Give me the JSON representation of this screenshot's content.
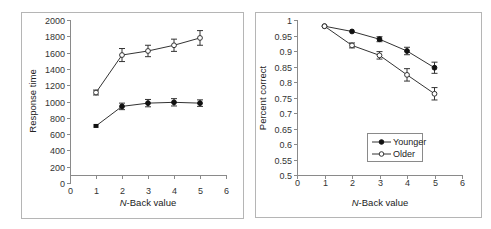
{
  "chart_data": [
    {
      "type": "line",
      "title": "",
      "xlabel_italic": "N",
      "xlabel_rest": "-Back value",
      "xlabel": "N-Back value",
      "ylabel": "Response time",
      "xlim": [
        0,
        6
      ],
      "ylim": [
        0,
        2000
      ],
      "x_ticks": [
        0,
        1,
        2,
        3,
        4,
        5,
        6
      ],
      "y_ticks": [
        0,
        200,
        400,
        600,
        800,
        1000,
        1200,
        1400,
        1600,
        1800,
        2000
      ],
      "x_axis_crosses_at": 100,
      "grid": false,
      "legend": false,
      "x": [
        1,
        2,
        3,
        4,
        5
      ],
      "series": [
        {
          "name": "Younger",
          "marker": "filled",
          "values": [
            700,
            940,
            980,
            990,
            980
          ],
          "errors": [
            15,
            40,
            45,
            45,
            40
          ]
        },
        {
          "name": "Older",
          "marker": "open",
          "values": [
            1110,
            1570,
            1620,
            1690,
            1780
          ],
          "errors": [
            30,
            80,
            70,
            75,
            90
          ]
        }
      ]
    },
    {
      "type": "line",
      "title": "",
      "xlabel_italic": "N",
      "xlabel_rest": "-Back value",
      "xlabel": "N-Back value",
      "ylabel": "Percent correct",
      "xlim": [
        0,
        6
      ],
      "ylim": [
        0.5,
        1
      ],
      "x_ticks": [
        0,
        1,
        2,
        3,
        4,
        5,
        6
      ],
      "y_ticks": [
        0.5,
        0.55,
        0.6,
        0.65,
        0.7,
        0.75,
        0.8,
        0.85,
        0.9,
        0.95,
        1
      ],
      "x_axis_crosses_at": 0.5,
      "grid": false,
      "legend": true,
      "legend_position": "lower-center",
      "x": [
        1,
        2,
        3,
        4,
        5
      ],
      "series": [
        {
          "name": "Younger",
          "marker": "filled",
          "values": [
            0.98,
            0.963,
            0.938,
            0.9,
            0.846
          ],
          "errors": [
            0.003,
            0.004,
            0.008,
            0.012,
            0.018
          ]
        },
        {
          "name": "Older",
          "marker": "open",
          "values": [
            0.98,
            0.918,
            0.886,
            0.823,
            0.762
          ],
          "errors": [
            0.003,
            0.008,
            0.012,
            0.02,
            0.02
          ]
        }
      ]
    }
  ],
  "left_panel": {
    "ylabel": "Response time",
    "xlabel_italic": "N",
    "xlabel_rest": "-Back value",
    "y_tick_labels": [
      "0",
      "200",
      "400",
      "600",
      "800",
      "1000",
      "1200",
      "1400",
      "1600",
      "1800",
      "2000"
    ],
    "x_tick_labels": [
      "0",
      "1",
      "2",
      "3",
      "4",
      "5",
      "6"
    ]
  },
  "right_panel": {
    "ylabel": "Percent correct",
    "xlabel_italic": "N",
    "xlabel_rest": "-Back value",
    "y_tick_labels": [
      "0.5",
      "0.55",
      "0.6",
      "0.65",
      "0.7",
      "0.75",
      "0.8",
      "0.85",
      "0.9",
      "0.95",
      "1"
    ],
    "x_tick_labels": [
      "0",
      "1",
      "2",
      "3",
      "4",
      "5",
      "6"
    ],
    "legend": [
      {
        "label": "Younger",
        "marker": "filled"
      },
      {
        "label": "Older",
        "marker": "open"
      }
    ]
  },
  "colors": {
    "line": "#333333",
    "marker_fill_filled": "#111111",
    "marker_fill_open": "#ffffff",
    "axis": "#8a8a8a",
    "frame": "#b5b5b5"
  }
}
